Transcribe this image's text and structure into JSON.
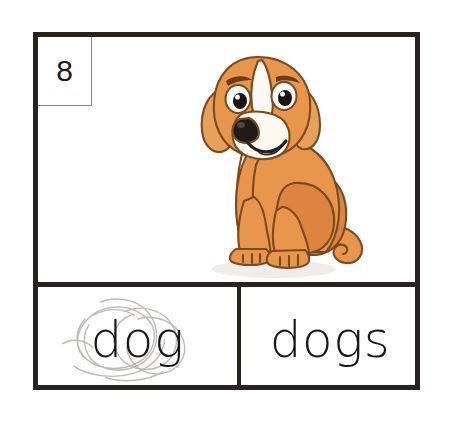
{
  "worksheet": {
    "card_number": "8",
    "picture": {
      "subject_icon": "dog-illustration",
      "description": "Cartoon tan and white beagle dog sitting and smiling",
      "colors": {
        "fur": "#E8964B",
        "fur_shadow": "#D4793A",
        "ear": "#E9A05A",
        "belly_white": "#FBF7F1",
        "outline": "#7A4A21",
        "nose": "#221A16",
        "eye": "#1B1410",
        "eye_white": "#FFFFFF",
        "mouth": "#2A201B"
      }
    },
    "answers": [
      {
        "label": "dog",
        "state": "crossed-out",
        "marking": "pencil-scribble",
        "marking_color": "#B8B5B2"
      },
      {
        "label": "dogs",
        "state": "selected",
        "marking": "none",
        "marking_color": "#18181a"
      }
    ],
    "colors": {
      "card_border": "#2b211d",
      "number_box_border": "#8d8680",
      "page_background": "#ffffff",
      "text": "#18181a"
    }
  }
}
